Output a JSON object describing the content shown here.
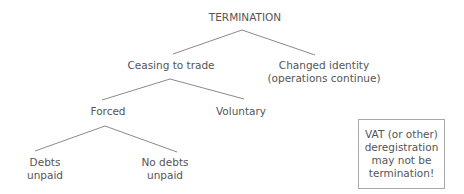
{
  "diagram": {
    "type": "tree",
    "root": {
      "label": "TERMINATION"
    },
    "level1": {
      "ceasing": {
        "label": "Ceasing to trade"
      },
      "changed": {
        "line1": "Changed identity",
        "line2": "(operations continue)"
      }
    },
    "level2": {
      "forced": {
        "label": "Forced"
      },
      "voluntary": {
        "label": "Voluntary"
      }
    },
    "level3": {
      "debts_unpaid": {
        "line1": "Debts",
        "line2": "unpaid"
      },
      "no_debts_unpaid": {
        "line1": "No debts",
        "line2": "unpaid"
      }
    },
    "note": {
      "line1": "VAT (or other)",
      "line2": "deregistration",
      "line3": "may not be",
      "line4": "termination!"
    },
    "edges": [
      {
        "from": "TERMINATION",
        "to": "Ceasing to trade"
      },
      {
        "from": "TERMINATION",
        "to": "Changed identity (operations continue)"
      },
      {
        "from": "Ceasing to trade",
        "to": "Forced"
      },
      {
        "from": "Ceasing to trade",
        "to": "Voluntary"
      },
      {
        "from": "Forced",
        "to": "Debts unpaid"
      },
      {
        "from": "Forced",
        "to": "No debts unpaid"
      }
    ],
    "colors": {
      "text": "#555555",
      "line": "#8a8a8a",
      "box_border": "#a8a8a8",
      "background": "#ffffff"
    }
  }
}
